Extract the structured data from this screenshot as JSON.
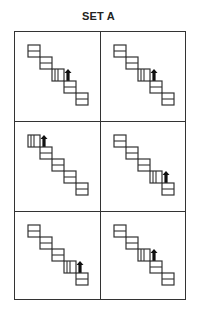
{
  "title": "SET A",
  "panels": [
    {
      "id": 1,
      "row": 0,
      "col": 0,
      "steps": 5,
      "split_step": 3
    },
    {
      "id": 2,
      "row": 0,
      "col": 1,
      "steps": 5,
      "split_step": 3
    },
    {
      "id": 3,
      "row": 1,
      "col": 0,
      "steps": 5,
      "split_step": 1
    },
    {
      "id": 4,
      "row": 1,
      "col": 1,
      "steps": 5,
      "split_step": 4
    },
    {
      "id": 5,
      "row": 2,
      "col": 0,
      "steps": 5,
      "split_step": 4
    },
    {
      "id": 6,
      "row": 2,
      "col": 1,
      "steps": 5,
      "split_step": 3
    }
  ],
  "colors": {
    "line": "#333333",
    "arrow": "#111111"
  }
}
